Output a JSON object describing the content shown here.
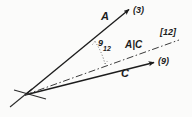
{
  "diagram": {
    "type": "vector-angle-diagram",
    "background_color": "#fbfbfa",
    "ink_color": "#1c1c1c",
    "vertex": {
      "x": 25,
      "y": 95
    },
    "rays": [
      {
        "name": "ray-A",
        "label": "A",
        "endpoint_label": "(3)",
        "style": "solid",
        "arrow": true,
        "from": {
          "x": 25,
          "y": 95
        },
        "to": {
          "x": 131,
          "y": 8
        }
      },
      {
        "name": "ray-C",
        "label": "C",
        "endpoint_label": "(9)",
        "style": "solid",
        "arrow": true,
        "from": {
          "x": 25,
          "y": 95
        },
        "to": {
          "x": 156,
          "y": 62
        }
      },
      {
        "name": "ray-bisector",
        "label": "A|C",
        "endpoint_label": "[12]",
        "style": "dash-dot",
        "arrow": false,
        "from": {
          "x": 25,
          "y": 95
        },
        "to": {
          "x": 179,
          "y": 40
        }
      }
    ],
    "angle_marker": {
      "name": "angle-theta-12",
      "label": "9",
      "subscript": "12",
      "style": "dotted",
      "between": [
        "ray-A",
        "ray-bisector"
      ]
    },
    "labels": {
      "A": "A",
      "A_endpoint": "(3)",
      "C": "C",
      "C_endpoint": "(9)",
      "bisector": "A|C",
      "bisector_endpoint": "[12]",
      "theta": "9",
      "theta_subscript": "12"
    }
  }
}
